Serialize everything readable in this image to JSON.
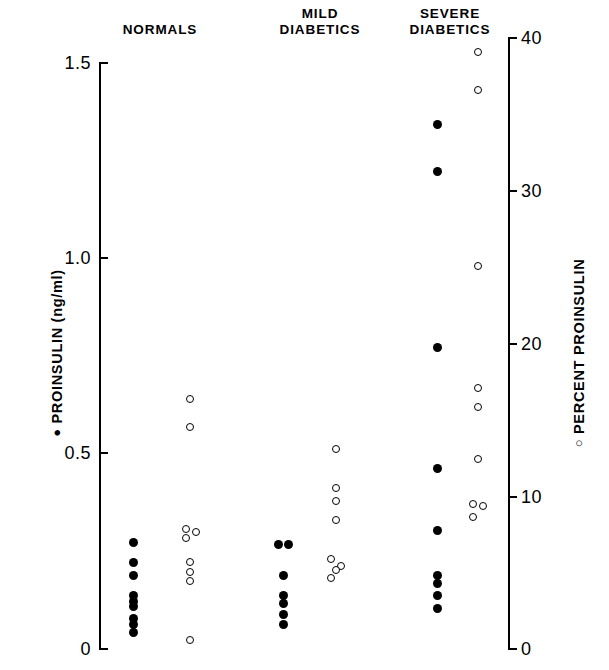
{
  "chart_data": {
    "type": "scatter",
    "title": "",
    "subtitle": "",
    "grid": false,
    "legend_position": "axis-labels",
    "xlabel": "",
    "categories": [
      "NORMALS",
      "MILD DIABETICS",
      "SEVERE DIABETICS"
    ],
    "axes": {
      "left": {
        "label": "PROINSULIN (ng/ml)",
        "marker": "filled-circle",
        "units": "ng/ml",
        "ylim": [
          0,
          1.5
        ],
        "ticks": [
          0,
          0.5,
          1.0,
          1.5
        ],
        "tick_labels": [
          "0",
          "0.5",
          "1.0",
          "1.5"
        ]
      },
      "right": {
        "label": "PERCENT PROINSULIN",
        "marker": "open-circle",
        "units": "%",
        "ylim": [
          0,
          40
        ],
        "ticks": [
          0,
          10,
          20,
          30,
          40
        ],
        "tick_labels": [
          "0",
          "10",
          "20",
          "30",
          "40"
        ]
      }
    },
    "series": [
      {
        "name": "PROINSULIN (ng/ml)",
        "marker": "filled-circle",
        "axis": "left",
        "groups": [
          {
            "category": "NORMALS",
            "values": [
              0.27,
              0.22,
              0.185,
              0.135,
              0.12,
              0.105,
              0.075,
              0.06,
              0.04
            ]
          },
          {
            "category": "MILD DIABETICS",
            "values": [
              0.265,
              0.265,
              0.185,
              0.135,
              0.115,
              0.085,
              0.06
            ]
          },
          {
            "category": "SEVERE DIABETICS",
            "values": [
              1.34,
              1.22,
              0.77,
              0.46,
              0.3,
              0.185,
              0.165,
              0.135,
              0.1
            ]
          }
        ]
      },
      {
        "name": "PERCENT PROINSULIN",
        "marker": "open-circle",
        "axis": "right",
        "groups": [
          {
            "category": "NORMALS",
            "values": [
              16.3,
              14.5,
              7.8,
              7.6,
              7.2,
              5.6,
              5.0,
              4.4,
              0.5
            ]
          },
          {
            "category": "MILD DIABETICS",
            "values": [
              13.0,
              10.5,
              9.6,
              8.4,
              5.8,
              5.4,
              5.1,
              4.6
            ]
          },
          {
            "category": "SEVERE DIABETICS",
            "values": [
              39.0,
              36.5,
              25.0,
              17.0,
              15.8,
              12.4,
              9.4,
              9.3,
              8.6
            ]
          }
        ]
      }
    ]
  },
  "headers": {
    "normals": "NORMALS",
    "mild": "MILD\nDIABETICS",
    "severe": "SEVERE\nDIABETICS"
  },
  "axis_labels": {
    "left_marker": "●",
    "left_text": " PROINSULIN  (ng/ml)",
    "right_marker": "○",
    "right_text": " PERCENT  PROINSULIN"
  },
  "left_ticks": [
    {
      "label": "1.5",
      "value": 1.5
    },
    {
      "label": "1.0",
      "value": 1.0
    },
    {
      "label": "0.5",
      "value": 0.5
    },
    {
      "label": "0",
      "value": 0
    }
  ],
  "right_ticks": [
    {
      "label": "40",
      "value": 40
    },
    {
      "label": "30",
      "value": 30
    },
    {
      "label": "20",
      "value": 20
    },
    {
      "label": "10",
      "value": 10
    },
    {
      "label": "0",
      "value": 0
    }
  ]
}
